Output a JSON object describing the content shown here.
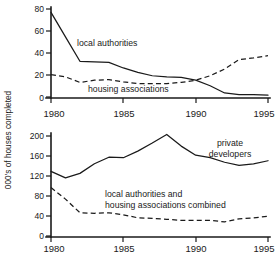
{
  "figure": {
    "ylabel": "000's of houses completed",
    "xticks": [
      "1980",
      "1985",
      "1990",
      "1995"
    ]
  },
  "chart_data": [
    {
      "type": "line",
      "panel": "top",
      "title": "",
      "xlabel": "",
      "ylabel": "000's of houses completed",
      "xlim": [
        1980,
        1995
      ],
      "ylim": [
        0,
        80
      ],
      "yticks": [
        0,
        20,
        40,
        60,
        80
      ],
      "xticks": [
        1980,
        1985,
        1990,
        1995
      ],
      "grid": false,
      "legend": "inline-annotations",
      "x": [
        1980,
        1981,
        1982,
        1983,
        1984,
        1985,
        1986,
        1987,
        1988,
        1989,
        1990,
        1991,
        1992,
        1993,
        1994,
        1995
      ],
      "series": [
        {
          "name": "local authorities",
          "style": "solid",
          "label_x": 1982.6,
          "label_y": 41,
          "values": [
            77,
            55,
            33,
            32.5,
            32,
            27,
            23,
            20,
            19,
            18.5,
            16,
            11,
            4.5,
            3,
            3,
            2.5
          ]
        },
        {
          "name": "housing associations",
          "style": "dashed",
          "label_x": 1984.6,
          "label_y": 6,
          "values": [
            21,
            19,
            14,
            16,
            16.5,
            14.5,
            13,
            13,
            13,
            14,
            16,
            20,
            26,
            34.5,
            36,
            38
          ]
        }
      ]
    },
    {
      "type": "line",
      "panel": "bottom",
      "title": "",
      "xlabel": "",
      "ylabel": "000's of houses completed",
      "xlim": [
        1980,
        1995
      ],
      "ylim": [
        0,
        200
      ],
      "yticks": [
        0,
        40,
        80,
        120,
        160,
        200
      ],
      "xticks": [
        1980,
        1985,
        1990,
        1995
      ],
      "grid": false,
      "legend": "inline-annotations",
      "x": [
        1980,
        1981,
        1982,
        1983,
        1984,
        1985,
        1986,
        1987,
        1988,
        1989,
        1990,
        1991,
        1992,
        1993,
        1994,
        1995
      ],
      "series": [
        {
          "name": "private developers",
          "style": "solid",
          "label_line1": "private",
          "label_line2": "developers",
          "values": [
            130,
            117,
            126,
            145,
            158,
            157,
            170,
            186,
            203,
            180,
            162,
            157,
            148,
            142,
            145,
            151
          ]
        },
        {
          "name": "local authorities and housing associations combined",
          "style": "dashed",
          "label_line1": "local authorities and",
          "label_line2": "housing associations combined",
          "values": [
            98,
            75,
            48,
            47,
            48,
            44,
            38,
            37,
            35,
            33,
            33,
            33,
            30,
            36,
            38,
            41
          ]
        }
      ]
    }
  ]
}
